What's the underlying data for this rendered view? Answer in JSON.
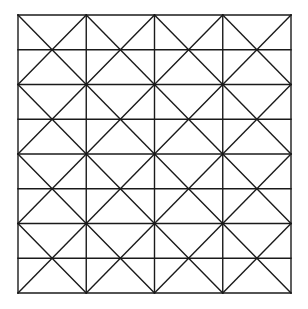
{
  "diagram": {
    "type": "grid-with-diagonals",
    "background": "#ffffff",
    "line_color": "#1a1a1a",
    "line_width": 1.4,
    "bounds": {
      "x0": 18,
      "y0": 15,
      "x1": 291,
      "y1": 293
    },
    "columns": 4,
    "rows": 8,
    "x_block_rows": 2
  }
}
